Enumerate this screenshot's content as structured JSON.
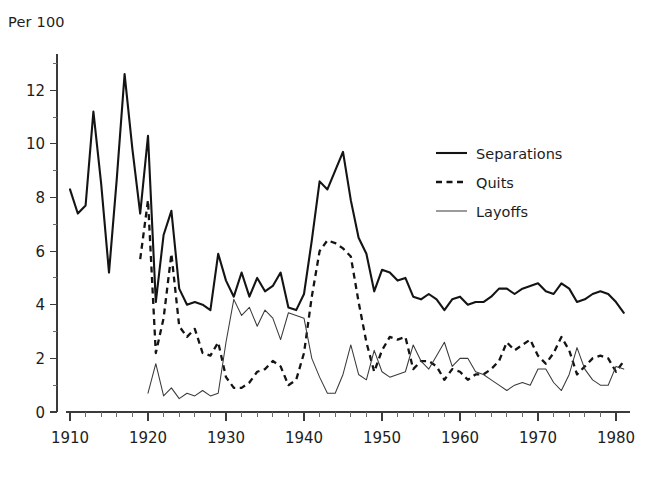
{
  "chart_data": {
    "type": "line",
    "title": "",
    "unit_label": "Per 100",
    "xlabel": "",
    "ylabel": "",
    "xlim": [
      1910,
      1981
    ],
    "ylim": [
      0,
      13.2
    ],
    "x_ticks": [
      1910,
      1920,
      1930,
      1940,
      1950,
      1960,
      1970,
      1980
    ],
    "x_tick_labels": [
      "1910",
      "1920",
      "1930",
      "1940",
      "1950",
      "1960",
      "1970",
      "1980"
    ],
    "x_minor_interval": 2,
    "y_ticks": [
      0,
      2,
      4,
      6,
      8,
      10,
      12
    ],
    "y_tick_labels": [
      "0",
      "2",
      "4",
      "6",
      "8",
      "10",
      "12"
    ],
    "y_minor_ticks": [
      1,
      3,
      5,
      7,
      9,
      11,
      13
    ],
    "grid": false,
    "legend_position": "upper-right",
    "series": [
      {
        "name": "Separations",
        "style": "solid-thick",
        "color": "#141414",
        "x": [
          1910,
          1911,
          1912,
          1913,
          1914,
          1915,
          1916,
          1917,
          1918,
          1919,
          1920,
          1921,
          1922,
          1923,
          1924,
          1925,
          1926,
          1927,
          1928,
          1929,
          1930,
          1931,
          1932,
          1933,
          1934,
          1935,
          1936,
          1937,
          1938,
          1939,
          1940,
          1941,
          1942,
          1943,
          1944,
          1945,
          1946,
          1947,
          1948,
          1949,
          1950,
          1951,
          1952,
          1953,
          1954,
          1955,
          1956,
          1957,
          1958,
          1959,
          1960,
          1961,
          1962,
          1963,
          1964,
          1965,
          1966,
          1967,
          1968,
          1969,
          1970,
          1971,
          1972,
          1973,
          1974,
          1975,
          1976,
          1977,
          1978,
          1979,
          1980,
          1981
        ],
        "y": [
          8.3,
          7.4,
          7.7,
          11.2,
          8.5,
          5.2,
          8.7,
          12.6,
          9.8,
          7.4,
          10.3,
          4.1,
          6.6,
          7.5,
          4.6,
          4.0,
          4.1,
          4.0,
          3.8,
          5.9,
          4.9,
          4.3,
          5.2,
          4.3,
          5.0,
          4.5,
          4.7,
          5.2,
          3.9,
          3.8,
          4.4,
          6.4,
          8.6,
          8.3,
          9.0,
          9.7,
          7.9,
          6.5,
          5.9,
          4.5,
          5.3,
          5.2,
          4.9,
          5.0,
          4.3,
          4.2,
          4.4,
          4.2,
          3.8,
          4.2,
          4.3,
          4.0,
          4.1,
          4.1,
          4.3,
          4.6,
          4.6,
          4.4,
          4.6,
          4.7,
          4.8,
          4.5,
          4.4,
          4.8,
          4.6,
          4.1,
          4.2,
          4.4,
          4.5,
          4.4,
          4.1,
          3.7
        ]
      },
      {
        "name": "Quits",
        "style": "dashed",
        "color": "#141414",
        "x": [
          1919,
          1920,
          1921,
          1922,
          1923,
          1924,
          1925,
          1926,
          1927,
          1928,
          1929,
          1930,
          1931,
          1932,
          1933,
          1934,
          1935,
          1936,
          1937,
          1938,
          1939,
          1940,
          1941,
          1942,
          1943,
          1944,
          1945,
          1946,
          1947,
          1948,
          1949,
          1950,
          1951,
          1952,
          1953,
          1954,
          1955,
          1956,
          1957,
          1958,
          1959,
          1960,
          1961,
          1962,
          1963,
          1964,
          1965,
          1966,
          1967,
          1968,
          1969,
          1970,
          1971,
          1972,
          1973,
          1974,
          1975,
          1976,
          1977,
          1978,
          1979,
          1980,
          1981
        ],
        "y": [
          5.7,
          7.9,
          2.2,
          3.5,
          5.9,
          3.2,
          2.8,
          3.1,
          2.2,
          2.1,
          2.6,
          1.3,
          0.9,
          0.9,
          1.1,
          1.5,
          1.6,
          1.9,
          1.7,
          1.0,
          1.2,
          2.2,
          4.3,
          6.0,
          6.4,
          6.3,
          6.1,
          5.8,
          4.1,
          2.6,
          1.5,
          2.3,
          2.8,
          2.7,
          2.8,
          1.6,
          1.9,
          1.9,
          1.7,
          1.2,
          1.6,
          1.5,
          1.2,
          1.4,
          1.4,
          1.6,
          1.9,
          2.6,
          2.3,
          2.5,
          2.7,
          2.1,
          1.8,
          2.2,
          2.8,
          2.3,
          1.4,
          1.7,
          2.0,
          2.1,
          2.0,
          1.5,
          1.9
        ]
      },
      {
        "name": "Layoffs",
        "style": "solid-thin",
        "color": "#3a3a3a",
        "x": [
          1920,
          1921,
          1922,
          1923,
          1924,
          1925,
          1926,
          1927,
          1928,
          1929,
          1930,
          1931,
          1932,
          1933,
          1934,
          1935,
          1936,
          1937,
          1938,
          1939,
          1940,
          1941,
          1942,
          1943,
          1944,
          1945,
          1946,
          1947,
          1948,
          1949,
          1950,
          1951,
          1952,
          1953,
          1954,
          1955,
          1956,
          1957,
          1958,
          1959,
          1960,
          1961,
          1962,
          1963,
          1964,
          1965,
          1966,
          1967,
          1968,
          1969,
          1970,
          1971,
          1972,
          1973,
          1974,
          1975,
          1976,
          1977,
          1978,
          1979,
          1980,
          1981
        ],
        "y": [
          0.7,
          1.8,
          0.6,
          0.9,
          0.5,
          0.7,
          0.6,
          0.8,
          0.6,
          0.7,
          2.6,
          4.2,
          3.6,
          3.9,
          3.2,
          3.8,
          3.5,
          2.7,
          3.7,
          3.6,
          3.5,
          2.0,
          1.3,
          0.7,
          0.7,
          1.4,
          2.5,
          1.4,
          1.2,
          2.3,
          1.5,
          1.3,
          1.4,
          1.5,
          2.5,
          1.9,
          1.6,
          2.1,
          2.6,
          1.7,
          2.0,
          2.0,
          1.5,
          1.4,
          1.2,
          1.0,
          0.8,
          1.0,
          1.1,
          1.0,
          1.6,
          1.6,
          1.1,
          0.8,
          1.4,
          2.4,
          1.6,
          1.2,
          1.0,
          1.0,
          1.7,
          1.6
        ]
      }
    ],
    "legend": [
      {
        "label": "Separations",
        "style": "solid-thick"
      },
      {
        "label": "Quits",
        "style": "dashed"
      },
      {
        "label": "Layoffs",
        "style": "solid-thin"
      }
    ]
  }
}
